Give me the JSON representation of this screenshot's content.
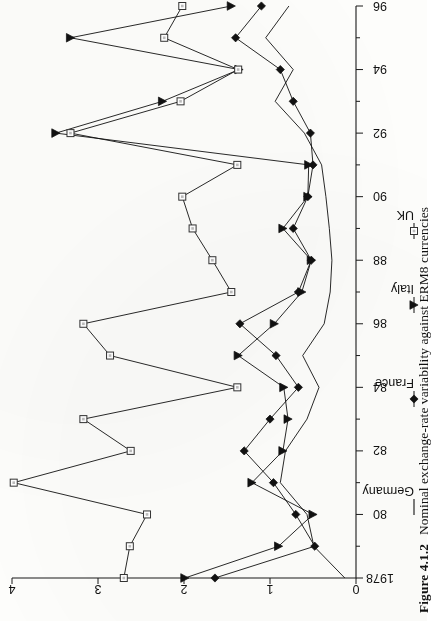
{
  "caption": {
    "label": "Figure 4.1.2",
    "text": "Nominal exchange-rate variability against ERM8 currencies"
  },
  "legend": {
    "items": [
      {
        "label": "Germany",
        "marker": "line"
      },
      {
        "label": "France",
        "marker": "filled-diamond"
      },
      {
        "label": "Italy",
        "marker": "filled-triangle"
      },
      {
        "label": "UK",
        "marker": "open-square"
      }
    ]
  },
  "axes": {
    "value_ticks": [
      "0",
      "1",
      "2",
      "3",
      "4"
    ],
    "time_ticks": [
      "1978",
      "80",
      "82",
      "84",
      "86",
      "88",
      "90",
      "92",
      "94",
      "96"
    ]
  },
  "chart_data": {
    "type": "line",
    "title": "Nominal exchange-rate variability against ERM8 currencies",
    "orientation": "rotated-90-ccw",
    "xlabel": "",
    "ylabel": "",
    "xlim": [
      1978,
      1996
    ],
    "ylim": [
      0,
      4
    ],
    "grid": false,
    "legend_position": "below-axis",
    "x": [
      1978,
      1979,
      1980,
      1981,
      1982,
      1983,
      1984,
      1985,
      1986,
      1987,
      1988,
      1989,
      1990,
      1991,
      1992,
      1993,
      1994,
      1995,
      1996
    ],
    "xtick_labels": [
      "1978",
      "80",
      "82",
      "84",
      "86",
      "88",
      "90",
      "92",
      "94",
      "96"
    ],
    "ytick_labels": [
      "0",
      "1",
      "2",
      "3",
      "4"
    ],
    "series": [
      {
        "name": "Germany",
        "marker": "none",
        "values": [
          0.13,
          0.49,
          0.57,
          0.88,
          0.82,
          0.57,
          0.43,
          0.62,
          0.37,
          0.3,
          0.28,
          0.31,
          0.35,
          0.4,
          0.6,
          0.94,
          0.73,
          1.05,
          0.78
        ]
      },
      {
        "name": "France",
        "marker": "filled-diamond",
        "values": [
          1.64,
          0.48,
          0.7,
          0.96,
          1.3,
          1.0,
          0.67,
          0.93,
          1.35,
          0.67,
          0.52,
          0.73,
          0.56,
          0.5,
          0.53,
          0.73,
          0.88,
          1.4,
          1.1
        ]
      },
      {
        "name": "Italy",
        "marker": "filled-triangle",
        "values": [
          1.99,
          0.9,
          0.5,
          1.21,
          0.85,
          0.79,
          0.84,
          1.37,
          0.95,
          0.63,
          0.52,
          0.85,
          0.56,
          0.55,
          3.49,
          2.25,
          1.36,
          3.32,
          1.45
        ]
      },
      {
        "name": "UK",
        "marker": "open-square",
        "values": [
          2.7,
          2.63,
          2.43,
          3.98,
          2.62,
          3.17,
          1.38,
          2.86,
          3.17,
          1.45,
          1.67,
          1.9,
          2.02,
          1.38,
          3.32,
          2.04,
          1.37,
          2.23,
          2.02
        ]
      }
    ]
  }
}
